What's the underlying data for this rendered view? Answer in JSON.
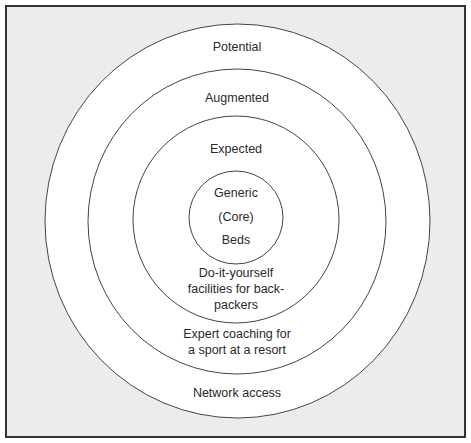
{
  "diagram": {
    "type": "concentric-product-levels",
    "colors": {
      "frame_border": "#333333",
      "frame_background": "#ececec",
      "ring_fill": "#ffffff",
      "ring_stroke": "#444444",
      "text": "#2a2a2a"
    },
    "rings": [
      {
        "level": "Potential",
        "example": "Network access"
      },
      {
        "level": "Augmented",
        "example": "Expert coaching for\na sport at a resort"
      },
      {
        "level": "Expected",
        "example": "Do-it-yourself\nfacilities for back-\npackers"
      },
      {
        "level": "Generic",
        "sublevel": "(Core)",
        "example": "Beds"
      }
    ]
  }
}
